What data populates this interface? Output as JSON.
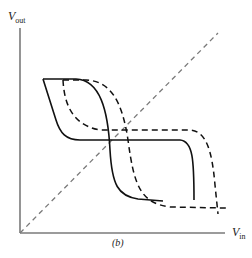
{
  "figure": {
    "caption": "(b)",
    "y_axis": {
      "label": "V",
      "label_sub": "out"
    },
    "x_axis": {
      "label": "V",
      "label_sub": "in"
    },
    "colors": {
      "axis": "#7a7a7a",
      "diagonal": "#7a7a7a",
      "curve": "#111111",
      "background": "#ffffff"
    },
    "elements": [
      {
        "name": "reference-diagonal",
        "style": "dashed",
        "description": "V_out = V_in line"
      },
      {
        "name": "solid-transfer-curve-forward",
        "style": "solid"
      },
      {
        "name": "solid-transfer-curve-reverse",
        "style": "solid"
      },
      {
        "name": "dashed-transfer-curve-forward",
        "style": "dashed"
      },
      {
        "name": "dashed-transfer-curve-reverse",
        "style": "dashed"
      }
    ]
  }
}
